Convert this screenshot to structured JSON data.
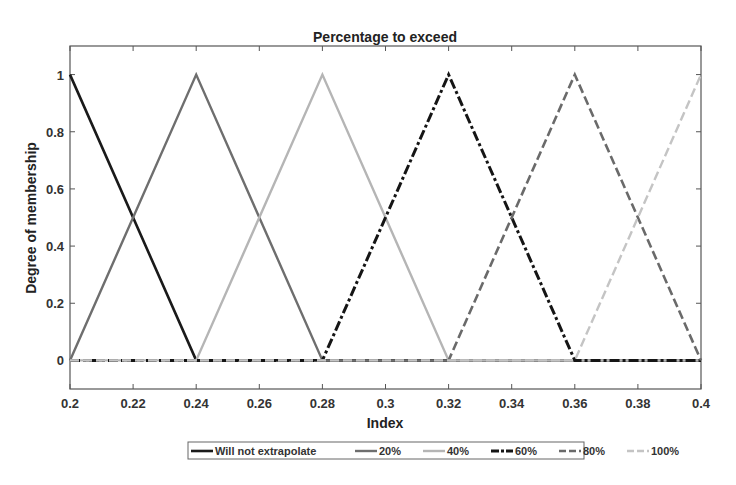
{
  "chart_data": {
    "type": "line",
    "title": "Percentage to exceed",
    "xlabel": "Index",
    "ylabel": "Degree of membership",
    "xlim": [
      0.2,
      0.4
    ],
    "ylim": [
      -0.1,
      1.1
    ],
    "xticks": [
      0.2,
      0.22,
      0.24,
      0.26,
      0.28,
      0.3,
      0.32,
      0.34,
      0.36,
      0.38,
      0.4
    ],
    "xtick_labels": [
      "0.2",
      "0.22",
      "0.24",
      "0.26",
      "0.28",
      "0.3",
      "0.32",
      "0.34",
      "0.36",
      "0.38",
      "0.4"
    ],
    "yticks": [
      0,
      0.2,
      0.4,
      0.6,
      0.8,
      1
    ],
    "ytick_labels": [
      "0",
      "0.2",
      "0.4",
      "0.6",
      "0.8",
      "1"
    ],
    "grid": false,
    "legend_position": "bottom-outside",
    "series": [
      {
        "name": "Will not extrapolate",
        "color": "#1a1a1a",
        "dash": "solid",
        "width": 2.6,
        "x": [
          0.2,
          0.24,
          0.4
        ],
        "y": [
          1,
          0,
          0
        ]
      },
      {
        "name": "20%",
        "color": "#6e6e6e",
        "dash": "solid",
        "width": 2.4,
        "x": [
          0.2,
          0.24,
          0.28,
          0.4
        ],
        "y": [
          0,
          1,
          0,
          0
        ]
      },
      {
        "name": "40%",
        "color": "#b5b5b5",
        "dash": "solid",
        "width": 2.4,
        "x": [
          0.2,
          0.24,
          0.28,
          0.32,
          0.4
        ],
        "y": [
          0,
          0,
          1,
          0,
          0
        ]
      },
      {
        "name": "60%",
        "color": "#151515",
        "dash": "dashdot",
        "width": 3,
        "x": [
          0.2,
          0.28,
          0.32,
          0.36,
          0.4
        ],
        "y": [
          0,
          0,
          1,
          0,
          0
        ]
      },
      {
        "name": "80%",
        "color": "#6a6a6a",
        "dash": "dashed",
        "width": 2.6,
        "x": [
          0.2,
          0.32,
          0.36,
          0.4
        ],
        "y": [
          0,
          0,
          1,
          0
        ]
      },
      {
        "name": "100%",
        "color": "#c4c4c4",
        "dash": "dashed",
        "width": 2.4,
        "x": [
          0.2,
          0.36,
          0.4
        ],
        "y": [
          0,
          0,
          1
        ]
      }
    ]
  }
}
